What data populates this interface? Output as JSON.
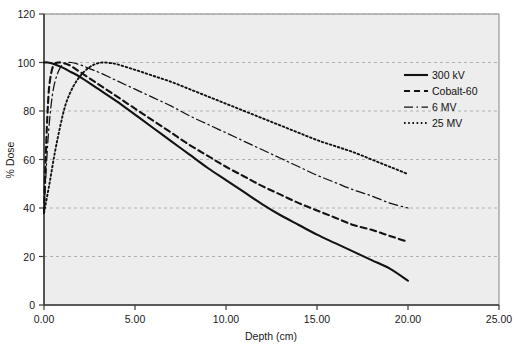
{
  "chart_data": {
    "type": "line",
    "title": "",
    "xlabel": "Depth (cm)",
    "ylabel": "% Dose",
    "xlim": [
      0,
      25
    ],
    "ylim": [
      0,
      120
    ],
    "xticks": [
      0,
      5,
      10,
      15,
      20,
      25
    ],
    "xtick_labels": [
      "0.00",
      "5.00",
      "10.00",
      "15.00",
      "20.00",
      "25.00"
    ],
    "yticks": [
      0,
      20,
      40,
      60,
      80,
      100,
      120
    ],
    "ytick_labels": [
      "0",
      "20",
      "40",
      "60",
      "80",
      "100",
      "120"
    ],
    "grid": "horizontal-dashed",
    "legend_position": "upper-right-inside",
    "series": [
      {
        "name": "300 kV",
        "style": "solid",
        "x": [
          0.0,
          0.2,
          0.5,
          1.0,
          1.5,
          2.0,
          3.0,
          4.0,
          5.0,
          6.0,
          7.0,
          8.0,
          9.0,
          10.0,
          11.0,
          12.0,
          13.0,
          14.0,
          15.0,
          16.0,
          17.0,
          18.0,
          19.0,
          20.0
        ],
        "y": [
          100,
          100,
          99.5,
          98,
          96,
          94,
          89,
          84,
          78.5,
          73,
          67.5,
          62,
          56.5,
          51.5,
          46.5,
          41.5,
          37,
          33,
          29,
          25.5,
          22,
          18.5,
          15,
          10
        ]
      },
      {
        "name": "Cobalt-60",
        "style": "dashed",
        "x": [
          0.0,
          0.1,
          0.2,
          0.3,
          0.5,
          0.8,
          1.2,
          1.5,
          2.0,
          3.0,
          4.0,
          5.0,
          6.0,
          7.0,
          8.0,
          9.0,
          10.0,
          11.0,
          12.0,
          13.0,
          14.0,
          15.0,
          16.0,
          17.0,
          18.0,
          19.0,
          20.0
        ],
        "y": [
          38,
          62,
          80,
          91,
          98.5,
          100,
          99.5,
          98.5,
          96,
          91,
          86,
          81,
          76,
          71,
          66,
          61.5,
          57,
          53,
          49,
          45.5,
          42,
          39,
          36,
          33,
          31,
          28.5,
          26
        ]
      },
      {
        "name": "6 MV",
        "style": "dashdot",
        "x": [
          0.0,
          0.2,
          0.4,
          0.6,
          0.9,
          1.2,
          1.5,
          2.0,
          2.5,
          3.0,
          4.0,
          5.0,
          6.0,
          7.0,
          8.0,
          9.0,
          10.0,
          11.0,
          12.0,
          13.0,
          14.0,
          15.0,
          16.0,
          17.0,
          18.0,
          19.0,
          20.0
        ],
        "y": [
          38,
          66,
          83,
          92,
          98,
          99.8,
          100,
          99,
          97.5,
          96,
          92.5,
          89,
          85.5,
          82,
          78,
          74.5,
          71,
          67.5,
          64,
          60.5,
          57,
          53.5,
          50.5,
          47.5,
          45,
          42,
          40
        ]
      },
      {
        "name": "25 MV",
        "style": "dotted",
        "x": [
          0.0,
          0.3,
          0.6,
          0.9,
          1.2,
          1.6,
          2.0,
          2.4,
          2.8,
          3.2,
          3.6,
          4.0,
          5.0,
          6.0,
          7.0,
          8.0,
          9.0,
          10.0,
          11.0,
          12.0,
          13.0,
          14.0,
          15.0,
          16.0,
          17.0,
          18.0,
          19.0,
          20.0
        ],
        "y": [
          38,
          50,
          63,
          74,
          83,
          90,
          94.5,
          97.5,
          99.3,
          100,
          99.8,
          99.3,
          97,
          94.5,
          92,
          89,
          86,
          83,
          80,
          77,
          74,
          71,
          68,
          65.5,
          63,
          60,
          57,
          54
        ]
      }
    ],
    "legend": [
      {
        "label": "300 kV",
        "style": "solid"
      },
      {
        "label": "Cobalt-60",
        "style": "dashed"
      },
      {
        "label": "6 MV",
        "style": "dashdot"
      },
      {
        "label": "25 MV",
        "style": "dotted"
      }
    ],
    "colors": {
      "curve": "#121212",
      "grid": "#a9a9a9",
      "axis": "#3a3a3a",
      "plot_background": "#ededed",
      "figure_background": "#ffffff",
      "text": "#1a1a1a"
    }
  }
}
